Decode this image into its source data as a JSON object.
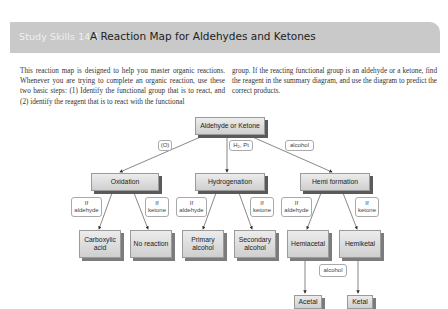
{
  "header": {
    "label": "Study Skills 14.1",
    "title": "A Reaction Map for Aldehydes and Ketones"
  },
  "body": {
    "left_paragraph": "This reaction map is designed to help you master organic reactions. Whenever you are trying to complete an organic reaction, use these two basic steps: (1) Identify the functional group that is to react, and (2) identify the reagent that is to react with the functional",
    "right_paragraph": "group. If the reacting functional group is an aldehyde or a ketone, find the reagent in the summary diagram, and use the diagram to predict the correct products."
  },
  "diagram": {
    "root": "Aldehyde or Ketone",
    "reagents": {
      "oxidation": "(O)",
      "hydrogenation": "H₂, Pt",
      "hemi": "alcohol"
    },
    "level2": {
      "oxidation": "Oxidation",
      "hydrogenation": "Hydrogenation",
      "hemi": "Hemi formation"
    },
    "conditions": {
      "if_aldehyde": "If aldehyde",
      "if_ketone": "If ketone"
    },
    "products": {
      "carboxylic_acid": "Carboxylic acid",
      "no_reaction": "No reaction",
      "primary_alcohol": "Primary alcohol",
      "secondary_alcohol": "Secondary alcohol",
      "hemiacetal": "Hemiacetal",
      "hemiketal": "Hemiketal"
    },
    "second_reagent": "alcohol",
    "final_products": {
      "acetal": "Acetal",
      "ketal": "Ketal"
    }
  }
}
